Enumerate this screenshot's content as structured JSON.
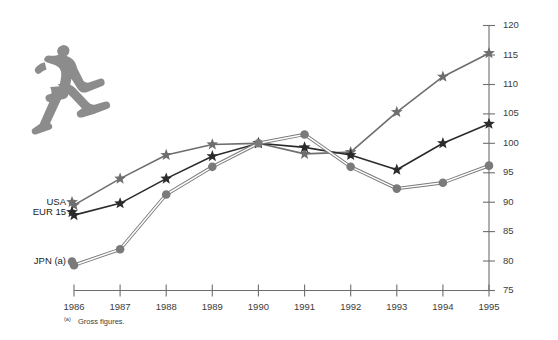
{
  "figure": {
    "illustration_name": "running-man-illustration",
    "footnote_mark": "(a)",
    "footnote_text": "Gross figures."
  },
  "colors": {
    "usa": "#6e6e6e",
    "eur15": "#2b2b2b",
    "jpn": "#7a7a7a",
    "axis": "#6e6e6e",
    "text": "#2b2b2b",
    "background": "#ffffff",
    "illustration": "#8c8c8c"
  },
  "chart_data": {
    "type": "line",
    "title": "",
    "subtitle": "",
    "xlabel": "",
    "ylabel": "",
    "categories": [
      "1986",
      "1987",
      "1988",
      "1989",
      "1990",
      "1991",
      "1992",
      "1993",
      "1994",
      "1995"
    ],
    "x": [
      1986,
      1987,
      1988,
      1989,
      1990,
      1991,
      1992,
      1993,
      1994,
      1995
    ],
    "ylim": [
      75,
      120
    ],
    "yticks": [
      75,
      80,
      85,
      90,
      95,
      100,
      105,
      110,
      115,
      120
    ],
    "ytick_labels": [
      "75",
      "80",
      "85",
      "90",
      "95",
      "100",
      "105",
      "110",
      "115",
      "120"
    ],
    "grid": false,
    "legend_position": "inline-left",
    "y_axis_position": "right",
    "series": [
      {
        "name": "USA",
        "label": "USA",
        "marker": "star",
        "color": "#6e6e6e",
        "line_style": "single",
        "values": [
          89.5,
          94.0,
          98.0,
          99.8,
          100.0,
          98.2,
          98.5,
          105.3,
          111.3,
          115.3
        ]
      },
      {
        "name": "EUR 15",
        "label": "EUR 15",
        "marker": "star",
        "color": "#2b2b2b",
        "line_style": "single",
        "values": [
          87.8,
          89.8,
          94.0,
          97.8,
          100.0,
          99.3,
          98.0,
          95.5,
          100.0,
          103.3
        ]
      },
      {
        "name": "JPN",
        "label": "JPN (a)",
        "marker": "circle",
        "color": "#7a7a7a",
        "line_style": "double",
        "values": [
          79.3,
          82.0,
          91.3,
          96.0,
          100.0,
          101.5,
          96.0,
          92.3,
          93.3,
          96.2
        ]
      }
    ]
  }
}
